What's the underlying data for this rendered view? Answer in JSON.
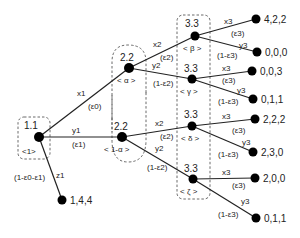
{
  "nodes": {
    "root": {
      "payoff_label": "1.1",
      "belief": "<1>"
    },
    "alpha": {
      "payoff_label": "2.2",
      "belief": "< α >"
    },
    "one_minus_alpha": {
      "payoff_label": "2.2",
      "belief": "< 1-α >"
    },
    "beta": {
      "payoff_label": "3.3",
      "belief": "< β >"
    },
    "gamma": {
      "payoff_label": "3.3",
      "belief": "< γ >"
    },
    "delta": {
      "payoff_label": "3.3",
      "belief": "< δ >"
    },
    "zeta": {
      "payoff_label": "3.3",
      "belief": "< ζ >"
    }
  },
  "edges": {
    "x1": {
      "action": "x1",
      "prob": "(ε0)"
    },
    "y1": {
      "action": "y1",
      "prob": "(ε1)"
    },
    "z1": {
      "action": "z1",
      "prob": "(1-ε0-ε1)"
    },
    "alpha_x2": {
      "action": "x2",
      "prob": "(ε2)"
    },
    "alpha_y2": {
      "action": "y2",
      "prob": "(1-ε2)"
    },
    "oma_x2": {
      "action": "x2",
      "prob": "(ε2)"
    },
    "oma_y2": {
      "action": "y2",
      "prob": "(1-ε2)"
    },
    "beta_x3": {
      "action": "x3",
      "prob": "(ε3)"
    },
    "beta_y3": {
      "action": "y3",
      "prob": "(1-ε3)"
    },
    "gamma_x3": {
      "action": "x3",
      "prob": "(ε3)"
    },
    "gamma_y3": {
      "action": "y3",
      "prob": "(1-ε3)"
    },
    "delta_x3": {
      "action": "x3",
      "prob": "(ε3)"
    },
    "delta_y3": {
      "action": "y3",
      "prob": "(1-ε3)"
    },
    "zeta_x3": {
      "action": "x3",
      "prob": "(ε3)"
    },
    "zeta_y3": {
      "action": "y3",
      "prob": "(1-ε3)"
    }
  },
  "leaves": {
    "z1": "1,4,4",
    "beta_x3": "4,2,2",
    "beta_y3": "0,0,0",
    "gamma_x3": "0,0,3",
    "gamma_y3": "0,1,1",
    "delta_x3": "2,2,2",
    "delta_y3": "2,3,0",
    "zeta_x3": "2,0,0",
    "zeta_y3": "0,1,1"
  }
}
